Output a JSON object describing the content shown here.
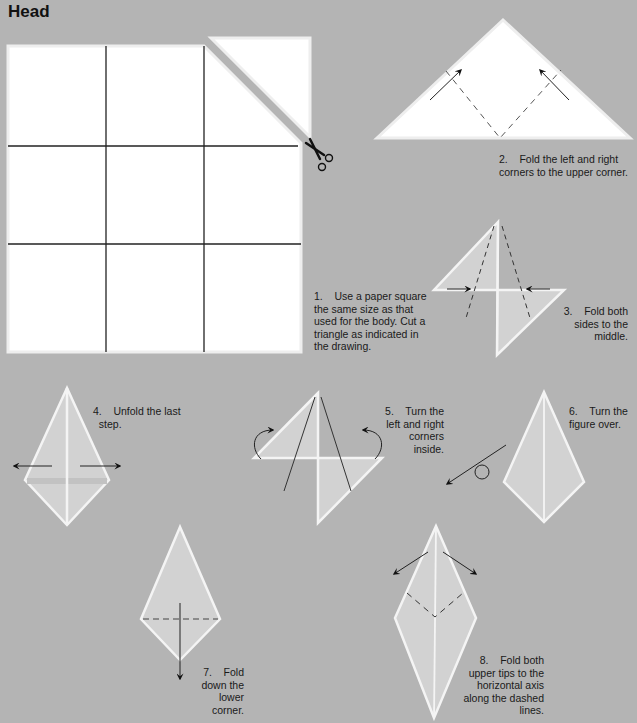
{
  "page": {
    "title": "Head",
    "background_color": "#b4b4b4",
    "paper_color": "#ffffff",
    "folded_paper_color": "#d2d2d2"
  },
  "steps": [
    {
      "number": "1.",
      "text": "Use a paper square\nthe same size as that\nused for the body. Cut a\ntriangle as indicated in\nthe drawing.",
      "icons": [
        "grid-square-icon",
        "cut-triangle-icon",
        "scissors-icon"
      ]
    },
    {
      "number": "2.",
      "text": "Fold the left and right\ncorners to the upper corner.",
      "icons": [
        "triangle-icon",
        "fold-arrow-icon",
        "dashed-fold-line-icon"
      ]
    },
    {
      "number": "3.",
      "text": "Fold both\nsides to the\nmiddle.",
      "icons": [
        "diamond-icon",
        "push-arrow-icon",
        "dashed-fold-line-icon"
      ]
    },
    {
      "number": "4.",
      "text": "Unfold the last\nstep.",
      "icons": [
        "kite-icon",
        "unfold-arrow-icon"
      ]
    },
    {
      "number": "5.",
      "text": "Turn the\nleft and right\ncorners\ninside.",
      "icons": [
        "diamond-icon",
        "curved-arrow-icon"
      ]
    },
    {
      "number": "6.",
      "text": "Turn the\nfigure over.",
      "icons": [
        "kite-icon",
        "turn-over-arrow-icon"
      ]
    },
    {
      "number": "7.",
      "text": "Fold\ndown the\nlower\ncorner.",
      "icons": [
        "kite-icon",
        "down-arrow-icon",
        "dashed-fold-line-icon"
      ]
    },
    {
      "number": "8.",
      "text": "Fold both\nupper tips to the\nhorizontal axis\nalong the dashed\nlines.",
      "icons": [
        "kite-icon",
        "outward-arrow-icon",
        "dashed-fold-line-icon"
      ]
    }
  ],
  "captions": {
    "s1": "1.    Use a paper square\nthe same size as that\nused for the body. Cut a\ntriangle as indicated in\nthe drawing.",
    "s2": "2.    Fold the left and right\ncorners to the upper corner.",
    "s3": "3.    Fold both\nsides to the\nmiddle.",
    "s4": "4.    Unfold the last\n  step.",
    "s5": "5.    Turn the\nleft and right\ncorners\ninside.",
    "s6": "6.    Turn the\nfigure over.",
    "s7": "7.    Fold\ndown the\nlower\ncorner.",
    "s8": "8.    Fold both\nupper tips to the\nhorizontal axis\nalong the dashed\nlines."
  }
}
